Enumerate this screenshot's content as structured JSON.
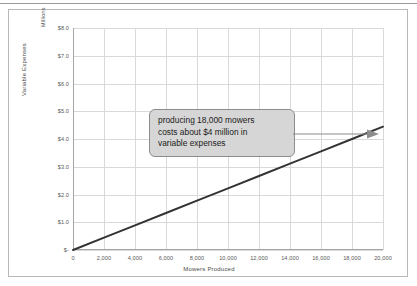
{
  "chart_data": {
    "type": "line",
    "title": "",
    "xlabel": "Mowers Produced",
    "ylabel": "Variable Expenses",
    "units_label": "Millions",
    "xlim": [
      0,
      20000
    ],
    "ylim": [
      0,
      8000000
    ],
    "grid": true,
    "legend": "none",
    "x_ticks": [
      "0",
      "2,000",
      "4,000",
      "6,000",
      "8,000",
      "10,000",
      "12,000",
      "14,000",
      "16,000",
      "18,000",
      "20,000"
    ],
    "x_tick_values": [
      0,
      2000,
      4000,
      6000,
      8000,
      10000,
      12000,
      14000,
      16000,
      18000,
      20000
    ],
    "y_ticks": [
      "$8.0",
      "$7.0",
      "$6.0",
      "$5.0",
      "$4.0",
      "$3.0",
      "$2.0",
      "$1.0",
      "$-"
    ],
    "y_tick_values": [
      8.0,
      7.0,
      6.0,
      5.0,
      4.0,
      3.0,
      2.0,
      1.0,
      0.0
    ],
    "series": [
      {
        "name": "Variable Expenses",
        "color": "#333333",
        "x": [
          0,
          2000,
          4000,
          6000,
          8000,
          10000,
          12000,
          14000,
          16000,
          18000,
          20000
        ],
        "values": [
          0.0,
          0.444,
          0.889,
          1.333,
          1.778,
          2.222,
          2.667,
          3.111,
          3.556,
          4.0,
          4.444
        ]
      }
    ],
    "annotations": [
      {
        "name": "callout",
        "lines": [
          "producing 18,000 mowers",
          "costs about $4 million in",
          "variable expenses"
        ],
        "points_to_x": 18000,
        "points_to_y": 4.0,
        "fill": "#d6d6d6",
        "border": "#8c8c8c"
      }
    ]
  },
  "axes": {
    "y_title": "Variable Expenses",
    "y_units": "Millions",
    "x_title": "Mowers Produced"
  },
  "callout": {
    "line1": "producing 18,000 mowers",
    "line2": "costs about $4 million in",
    "line3": "variable expenses"
  },
  "colors": {
    "line": "#333333",
    "grid": "#d9d9d9",
    "axis": "#a6a6a6",
    "frame": "#b8b8b8",
    "callout_fill": "#d6d6d6",
    "callout_border": "#8c8c8c",
    "arrow": "#8c8c8c"
  }
}
